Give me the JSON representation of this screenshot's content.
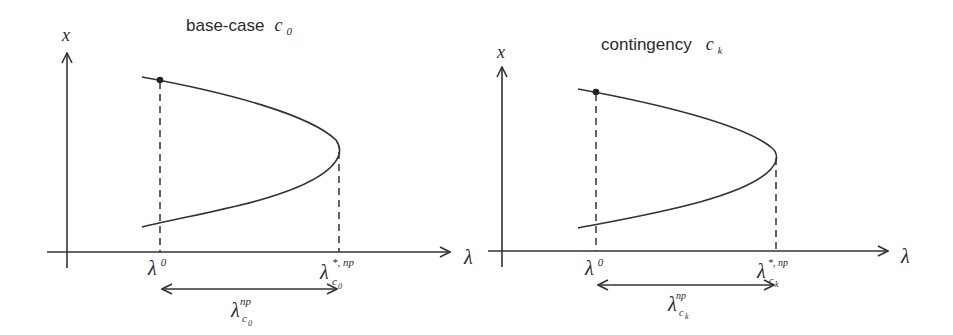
{
  "panels": [
    {
      "title_text": "base-case",
      "title_symbol": "c",
      "title_subscript": "0",
      "y_axis_label": "x",
      "x_axis_label": "λ",
      "tick_left": {
        "symbol": "λ",
        "superscript": "0"
      },
      "tick_right": {
        "symbol": "λ",
        "superscript": "*, np",
        "subscript": "c",
        "sub_subscript": "0"
      },
      "margin_label": {
        "symbol": "λ",
        "superscript": "np",
        "subscript": "c",
        "sub_subscript": "0"
      }
    },
    {
      "title_text": "contingency",
      "title_symbol": "c",
      "title_subscript": "k",
      "y_axis_label": "x",
      "x_axis_label": "λ",
      "tick_left": {
        "symbol": "λ",
        "superscript": "0"
      },
      "tick_right": {
        "symbol": "λ",
        "superscript": "*, np",
        "subscript": "c",
        "sub_subscript": "k"
      },
      "margin_label": {
        "symbol": "λ",
        "superscript": "np",
        "subscript": "c",
        "sub_subscript": "k"
      }
    }
  ],
  "colors": {
    "ink": "#333333",
    "background": "#ffffff"
  }
}
